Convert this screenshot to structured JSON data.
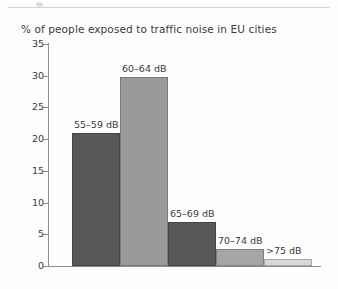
{
  "page": {
    "background_color": "#fefefe",
    "scan_rule_color": "#d5d5d5"
  },
  "chart_data": {
    "type": "bar",
    "title": "% of people exposed to traffic noise in EU cities",
    "xlabel": "",
    "ylabel": "",
    "ylim": [
      0,
      35
    ],
    "yticks": [
      0,
      5,
      10,
      15,
      20,
      25,
      30,
      35
    ],
    "ytick_labels": [
      "0",
      "5",
      "10",
      "15",
      "20",
      "25",
      "30",
      "35"
    ],
    "grid": false,
    "legend": "none",
    "categories": [
      "55–59 dB",
      "60–64 dB",
      "65–69 dB",
      "70–74 dB",
      ">75 dB"
    ],
    "values": [
      21,
      29.8,
      7,
      2.7,
      1.1
    ],
    "bar_colors": [
      "#585858",
      "#9a9a9a",
      "#585858",
      "#a6a6a6",
      "#d8d8d8"
    ],
    "bars": [
      {
        "label": "55–59 dB",
        "value": 21,
        "color": "#585858"
      },
      {
        "label": "60–64 dB",
        "value": 29.8,
        "color": "#9a9a9a"
      },
      {
        "label": "65–69 dB",
        "value": 7,
        "color": "#585858"
      },
      {
        "label": "70–74 dB",
        "value": 2.7,
        "color": "#a6a6a6"
      },
      {
        "label": ">75 dB",
        "value": 1.1,
        "color": "#d8d8d8"
      }
    ]
  }
}
